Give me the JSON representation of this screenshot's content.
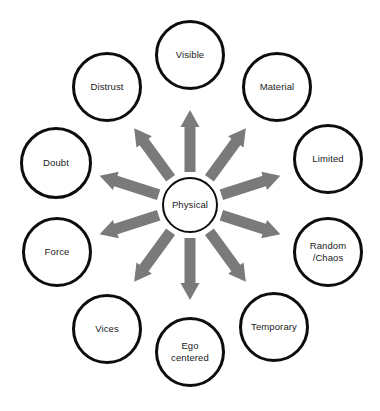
{
  "diagram": {
    "type": "radial-hub-and-spoke",
    "title": "",
    "center": {
      "id": "physical",
      "label": "Physical",
      "cx": 190,
      "cy": 205,
      "r": 28
    },
    "style": {
      "circle_fill": "#ffffff",
      "circle_stroke": "#0d0d0d",
      "arrow_color": "#7a7a7a",
      "text_color": "#1a1a1a",
      "background": "#ffffff"
    },
    "nodes": [
      {
        "id": "visible",
        "label": "Visible",
        "cx": 190,
        "cy": 55,
        "r": 35,
        "angle": -90
      },
      {
        "id": "material",
        "label": "Material",
        "cx": 277,
        "cy": 87,
        "r": 35,
        "angle": -54
      },
      {
        "id": "limited",
        "label": "Limited",
        "cx": 328,
        "cy": 159,
        "r": 35,
        "angle": -18
      },
      {
        "id": "random-chaos",
        "label": "Random\n/Chaos",
        "cx": 328,
        "cy": 252,
        "r": 35,
        "angle": 18
      },
      {
        "id": "temporary",
        "label": "Temporary",
        "cx": 274,
        "cy": 327,
        "r": 35,
        "angle": 54
      },
      {
        "id": "ego-centered",
        "label": "Ego\ncentered",
        "cx": 190,
        "cy": 352,
        "r": 35,
        "angle": 90
      },
      {
        "id": "vices",
        "label": "Vices",
        "cx": 107,
        "cy": 329,
        "r": 35,
        "angle": 126
      },
      {
        "id": "force",
        "label": "Force",
        "cx": 57,
        "cy": 252,
        "r": 35,
        "angle": 162
      },
      {
        "id": "doubt",
        "label": "Doubt",
        "cx": 56,
        "cy": 163,
        "r": 36,
        "angle": 198
      },
      {
        "id": "distrust",
        "label": "Distrust",
        "cx": 107,
        "cy": 87,
        "r": 35,
        "angle": 234
      }
    ],
    "arrows": [
      {
        "id": "arrow-to-visible",
        "target": "visible",
        "angle": -90,
        "inner": 33,
        "outer": 95
      },
      {
        "id": "arrow-to-material",
        "target": "material",
        "angle": -54,
        "inner": 33,
        "outer": 95
      },
      {
        "id": "arrow-to-limited",
        "target": "limited",
        "angle": -18,
        "inner": 33,
        "outer": 95
      },
      {
        "id": "arrow-to-random-chaos",
        "target": "random-chaos",
        "angle": 18,
        "inner": 33,
        "outer": 95
      },
      {
        "id": "arrow-to-temporary",
        "target": "temporary",
        "angle": 54,
        "inner": 33,
        "outer": 95
      },
      {
        "id": "arrow-to-ego-centered",
        "target": "ego-centered",
        "angle": 90,
        "inner": 33,
        "outer": 95
      },
      {
        "id": "arrow-to-vices",
        "target": "vices",
        "angle": 126,
        "inner": 33,
        "outer": 95
      },
      {
        "id": "arrow-to-force",
        "target": "force",
        "angle": 162,
        "inner": 33,
        "outer": 95
      },
      {
        "id": "arrow-to-doubt",
        "target": "doubt",
        "angle": 198,
        "inner": 33,
        "outer": 95
      },
      {
        "id": "arrow-to-distrust",
        "target": "distrust",
        "angle": 234,
        "inner": 33,
        "outer": 95
      }
    ]
  }
}
